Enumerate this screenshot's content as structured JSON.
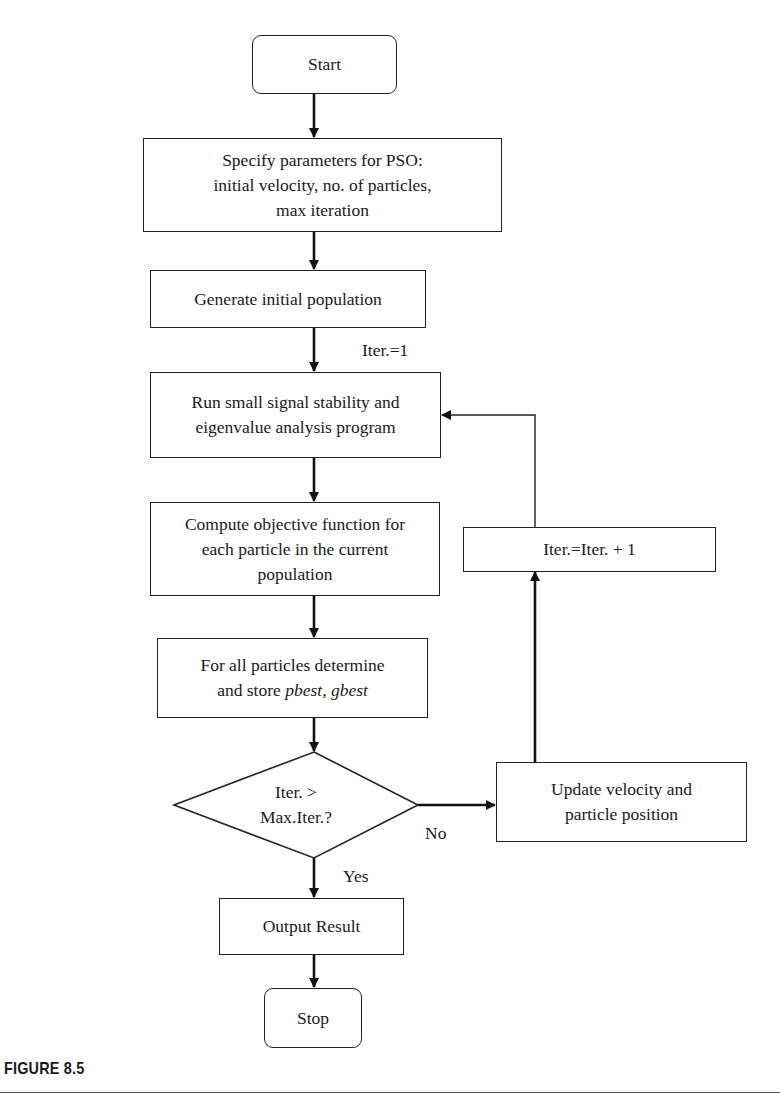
{
  "flowchart": {
    "nodes": {
      "start": {
        "text": "Start",
        "shape": "terminal"
      },
      "specify": {
        "lines": [
          "Specify parameters for PSO:",
          "initial velocity, no. of particles,",
          "max iteration"
        ],
        "shape": "process"
      },
      "generate": {
        "text": "Generate initial population",
        "shape": "process"
      },
      "run": {
        "lines": [
          "Run small signal stability and",
          "eigenvalue analysis program"
        ],
        "shape": "process"
      },
      "compute": {
        "lines": [
          "Compute objective function for",
          "each particle in the current",
          "population"
        ],
        "shape": "process"
      },
      "determine": {
        "line1": "For all particles determine",
        "line2_prefix": "and store ",
        "pbest": "pbest,",
        "gbest": " gbest",
        "shape": "process"
      },
      "decision": {
        "lines": [
          "Iter. >",
          "Max.Iter.?"
        ],
        "shape": "decision"
      },
      "update": {
        "lines": [
          "Update velocity and",
          "particle position"
        ],
        "shape": "process"
      },
      "increment": {
        "text": "Iter.=Iter. + 1",
        "shape": "process"
      },
      "output": {
        "text": "Output Result",
        "shape": "process"
      },
      "stop": {
        "text": "Stop",
        "shape": "terminal"
      }
    },
    "edge_labels": {
      "iter_init": "Iter.=1",
      "no": "No",
      "yes": "Yes"
    },
    "edges": [
      [
        "start",
        "specify"
      ],
      [
        "specify",
        "generate"
      ],
      [
        "generate",
        "run"
      ],
      [
        "run",
        "compute"
      ],
      [
        "compute",
        "determine"
      ],
      [
        "determine",
        "decision"
      ],
      [
        "decision",
        "update",
        "No"
      ],
      [
        "update",
        "increment"
      ],
      [
        "increment",
        "run"
      ],
      [
        "decision",
        "output",
        "Yes"
      ],
      [
        "output",
        "stop"
      ]
    ]
  },
  "caption": "FIGURE 8.5",
  "colors": {
    "stroke": "#222222",
    "background": "#ffffff",
    "text": "#1a1a1a"
  }
}
